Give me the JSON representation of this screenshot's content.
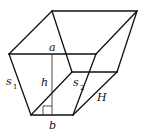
{
  "diagram": {
    "type": "frustum-of-prism-figure",
    "line_color": "#111111",
    "background": "#ffffff",
    "labels": {
      "a": "a",
      "b": "b",
      "h": "h",
      "s1_base": "s",
      "s1_sub": "1",
      "s2_base": "s",
      "s2_sub": "2",
      "H": "H"
    }
  }
}
